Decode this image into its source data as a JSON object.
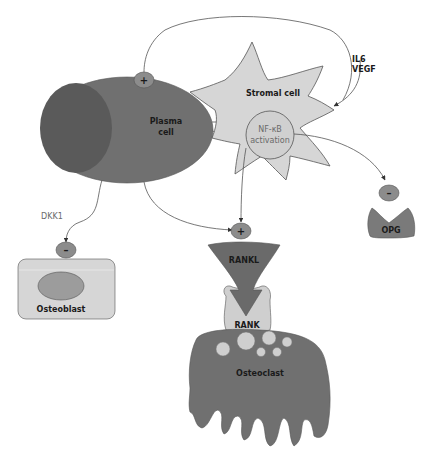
{
  "diagram": {
    "colors": {
      "dark_cell": "#6e6e6e",
      "darker_nucleus": "#555555",
      "light_cell": "#d6d6d6",
      "mid_cell": "#b8b8b8",
      "sign_circle": "#8c8c8c",
      "line": "#555555"
    },
    "nodes": {
      "plasma_cell": {
        "label_line1": "Plasma",
        "label_line2": "cell"
      },
      "stromal_cell": {
        "label": "Stromal cell"
      },
      "nfkb": {
        "label_line1": "NF-κB",
        "label_line2": "activation"
      },
      "osteoblast": {
        "label": "Osteoblast"
      },
      "rankl": {
        "label": "RANKL"
      },
      "rank": {
        "label": "RANK"
      },
      "osteoclast": {
        "label": "Osteoclast"
      },
      "opg": {
        "label": "OPG"
      }
    },
    "signals": {
      "il6": "IL6",
      "vegf": "VEGF",
      "dkk1": "DKK1"
    },
    "regulators": {
      "plasma_plus": "+",
      "rankl_plus": "+",
      "osteoblast_minus": "–",
      "opg_minus": "–"
    },
    "edges": [
      {
        "from": "stromal_cell",
        "to": "plasma_cell",
        "effect": "+",
        "via": "IL6, VEGF"
      },
      {
        "from": "plasma_cell",
        "to": "stromal_cell",
        "effect": "IL6, VEGF"
      },
      {
        "from": "plasma_cell",
        "to": "osteoblast",
        "effect": "–",
        "via": "DKK1"
      },
      {
        "from": "plasma_cell",
        "to": "rankl",
        "effect": "+"
      },
      {
        "from": "nfkb",
        "to": "rankl",
        "effect": "+"
      },
      {
        "from": "nfkb",
        "to": "opg",
        "effect": "–"
      },
      {
        "from": "rankl",
        "to": "rank",
        "effect": "binds"
      }
    ]
  }
}
